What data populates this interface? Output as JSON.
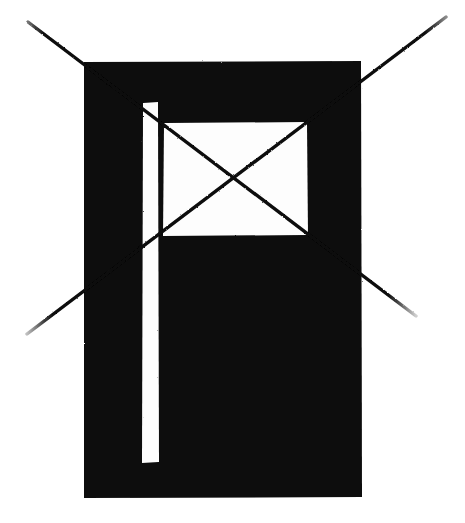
{
  "figure": {
    "title": "Crossed-out flag glyph",
    "description": "A solid black rectangular panel containing a white flag shape (vertical pole stripe plus a rectangular banner), overlaid with a large X made of two thin hand-drawn diagonal strokes extending beyond the panel.",
    "background_color": "#ffffff",
    "ink_color": "#080808",
    "paper_color": "#fdfdfd",
    "canvas": {
      "width": 465,
      "height": 523
    },
    "elements": {
      "panel": {
        "name": "black-panel",
        "fill": "#080808",
        "x": 83,
        "y": 61,
        "width": 279,
        "height": 437
      },
      "pole_stripe": {
        "name": "flag-pole-stripe",
        "fill": "#fdfdfd",
        "x": 142,
        "y": 102,
        "width": 17,
        "height": 361
      },
      "banner": {
        "name": "flag-banner",
        "fill": "#fdfdfd",
        "x": 163,
        "y": 122,
        "width": 145,
        "height": 114
      },
      "stroke_a": {
        "name": "diagonal-stroke-top-left-to-bottom-right",
        "x1": 28,
        "y1": 22,
        "x2": 416,
        "y2": 316,
        "stroke_width": 3.4
      },
      "stroke_b": {
        "name": "diagonal-stroke-top-right-to-bottom-left",
        "x1": 446,
        "y1": 17,
        "x2": 27,
        "y2": 334,
        "stroke_width": 3.4
      },
      "crossing_point": {
        "x": 233,
        "y": 182
      }
    }
  }
}
